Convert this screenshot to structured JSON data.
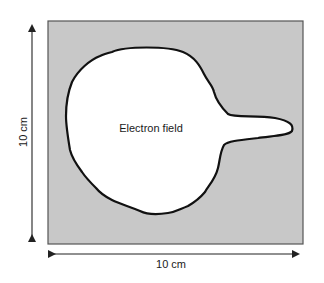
{
  "diagram": {
    "field_label": "Electron field",
    "width_label": "10 cm",
    "height_label": "10 cm",
    "colors": {
      "background": "#ffffff",
      "square_fill": "#c8c8c8",
      "square_border": "#555555",
      "field_fill": "#ffffff",
      "field_outline": "#111111",
      "arrow": "#222222"
    }
  }
}
